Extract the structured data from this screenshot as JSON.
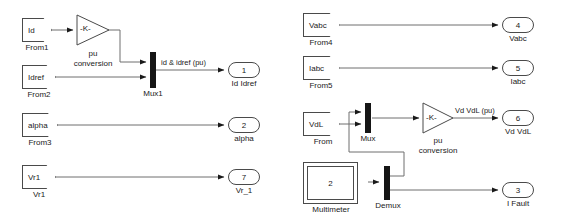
{
  "diagram": {
    "line_color": "#6e6e6e",
    "block_border_color": "#4a4a4a",
    "mux_color": "#151515",
    "text_color": "#1a1a1a"
  },
  "from_blocks": [
    {
      "tag": "Id",
      "caption": "From1"
    },
    {
      "tag": "Idref",
      "caption": "From2"
    },
    {
      "tag": "alpha",
      "caption": "From3"
    },
    {
      "tag": "Vr1",
      "caption": "Vr1"
    },
    {
      "tag": "Vabc",
      "caption": "From4"
    },
    {
      "tag": "Iabc",
      "caption": "From5"
    },
    {
      "tag": "VdL",
      "caption": "From"
    }
  ],
  "gain_blocks": [
    {
      "value": "-K-",
      "caption_line1": "pu",
      "caption_line2": "conversion"
    },
    {
      "value": "-K-",
      "caption_line1": "pu",
      "caption_line2": "conversion"
    }
  ],
  "mux_blocks": [
    {
      "caption": "Mux1",
      "inputs": 2
    },
    {
      "caption": "Mux",
      "inputs": 2
    },
    {
      "caption": "Demux",
      "outputs": 2
    }
  ],
  "multimeter": {
    "value": "2",
    "caption": "Multimeter"
  },
  "out_ports": [
    {
      "number": "1",
      "caption": "Id Idref"
    },
    {
      "number": "2",
      "caption": "alpha"
    },
    {
      "number": "7",
      "caption": "Vr_1"
    },
    {
      "number": "4",
      "caption": "Vabc"
    },
    {
      "number": "5",
      "caption": "Iabc"
    },
    {
      "number": "6",
      "caption": "Vd VdL"
    },
    {
      "number": "3",
      "caption": "I Fault"
    }
  ],
  "signal_labels": [
    {
      "text": "id & idref (pu)"
    },
    {
      "text": "Vd VdL (pu)"
    }
  ]
}
